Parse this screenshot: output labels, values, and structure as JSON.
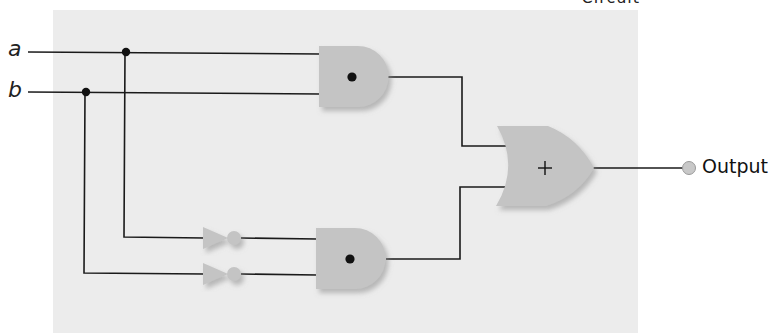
{
  "caption": {
    "text": "• • • Circuit",
    "note": "partially cropped at top edge"
  },
  "inputs": [
    {
      "label": "a"
    },
    {
      "label": "b"
    }
  ],
  "gates": [
    {
      "id": "and-top",
      "type": "AND",
      "symbol": "•"
    },
    {
      "id": "and-bottom",
      "type": "AND",
      "symbol": "•"
    },
    {
      "id": "not-a",
      "type": "NOT"
    },
    {
      "id": "not-b",
      "type": "NOT"
    },
    {
      "id": "or-final",
      "type": "OR",
      "symbol": "+"
    }
  ],
  "output": {
    "label": "Output"
  },
  "colors": {
    "panel": "#ececec",
    "gate_fill": "#c4c4c4",
    "gate_shadow": "#a9a9a9",
    "wire": "#1a1a1a",
    "junction": "#111111"
  }
}
